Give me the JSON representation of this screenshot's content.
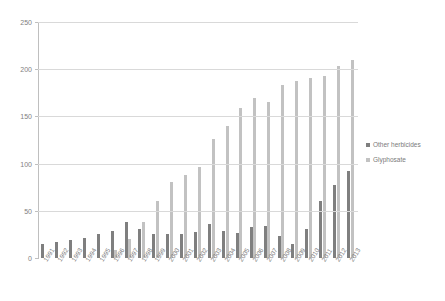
{
  "title": "",
  "legend": {
    "position": "right",
    "items": [
      {
        "label": "Other herbicides",
        "color": "#7f7f7f",
        "key": "other"
      },
      {
        "label": "Glyphosate",
        "color": "#c2c2c2",
        "key": "gly"
      }
    ]
  },
  "axis": {
    "y_ticks": [
      "0",
      "50",
      "100",
      "150",
      "200",
      "250"
    ],
    "x_label": "",
    "y_label": ""
  },
  "chart_data": {
    "type": "bar",
    "title": "",
    "xlabel": "",
    "ylabel": "",
    "ylim": [
      0,
      250
    ],
    "yticks": [
      0,
      50,
      100,
      150,
      200,
      250
    ],
    "grid": true,
    "legend_position": "right",
    "categories": [
      "1991",
      "1992",
      "1993",
      "1994",
      "1995",
      "1996",
      "1997",
      "1998",
      "1999",
      "2000",
      "2001",
      "2002",
      "2003",
      "2004",
      "2005",
      "2006",
      "2007",
      "2008",
      "2009",
      "2010",
      "2011",
      "2012",
      "2013"
    ],
    "series": [
      {
        "name": "Other herbicides",
        "color": "#7f7f7f",
        "values": [
          15,
          17,
          19,
          21,
          25,
          29,
          38,
          31,
          25,
          25,
          25,
          28,
          36,
          29,
          27,
          33,
          34,
          23,
          15,
          31,
          60,
          77,
          92
        ]
      },
      {
        "name": "Glyphosate",
        "color": "#c2c2c2",
        "values": [
          0,
          0,
          0,
          0,
          0,
          9,
          20,
          38,
          60,
          81,
          88,
          96,
          126,
          140,
          159,
          170,
          165,
          183,
          188,
          191,
          193,
          203,
          210
        ]
      }
    ]
  }
}
